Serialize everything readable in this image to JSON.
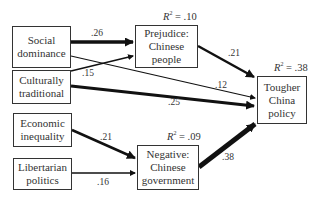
{
  "diagram": {
    "type": "path-model",
    "nodes": [
      {
        "id": "social_dominance",
        "lines": [
          "Social",
          "dominance"
        ]
      },
      {
        "id": "culturally_traditional",
        "lines": [
          "Culturally",
          "traditional"
        ]
      },
      {
        "id": "economic_inequality",
        "lines": [
          "Economic",
          "inequality"
        ]
      },
      {
        "id": "libertarian_politics",
        "lines": [
          "Libertarian",
          "politics"
        ]
      },
      {
        "id": "prejudice",
        "lines": [
          "Prejudice:",
          "Chinese",
          "people"
        ],
        "r2": ".10"
      },
      {
        "id": "negative_gov",
        "lines": [
          "Negative:",
          "Chinese",
          "government"
        ],
        "r2": ".09"
      },
      {
        "id": "tougher_policy",
        "lines": [
          "Tougher",
          "China",
          "policy"
        ],
        "r2": ".38"
      }
    ],
    "edges": [
      {
        "from": "social_dominance",
        "to": "prejudice",
        "coef": ".26"
      },
      {
        "from": "culturally_traditional",
        "to": "prejudice",
        "coef": ".15"
      },
      {
        "from": "social_dominance",
        "to": "tougher_policy",
        "coef": ".12"
      },
      {
        "from": "culturally_traditional",
        "to": "tougher_policy",
        "coef": ".25"
      },
      {
        "from": "prejudice",
        "to": "tougher_policy",
        "coef": ".21"
      },
      {
        "from": "economic_inequality",
        "to": "negative_gov",
        "coef": ".21"
      },
      {
        "from": "libertarian_politics",
        "to": "negative_gov",
        "coef": ".16"
      },
      {
        "from": "negative_gov",
        "to": "tougher_policy",
        "coef": ".38"
      }
    ],
    "r2_prefix": "R",
    "r2_sup": "2",
    "r2_eq": " = "
  }
}
